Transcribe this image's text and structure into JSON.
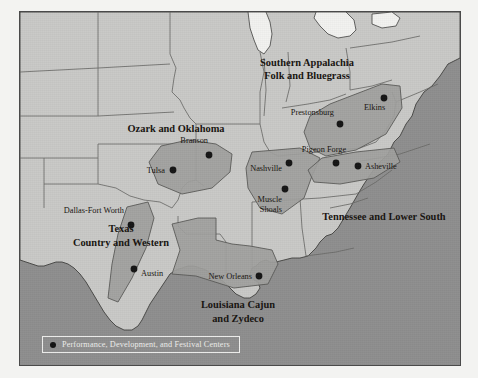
{
  "figure": {
    "type": "thematic-map",
    "colors": {
      "water": "#8e8e8e",
      "land": "#c9c9c7",
      "lake": "#f2f2f0",
      "region_fill": "#9f9f9d",
      "region_outline": "#5a5a58",
      "state_border": "#6a6a68",
      "coastline": "#3f3f3d",
      "label_text": "#17130f",
      "legend_text": "#efefed",
      "plate_border": "#4a4a4a",
      "paper": "#f3f3f1"
    }
  },
  "regions": [
    {
      "id": "southern-appalachia",
      "label": "Southern Appalachia\nFolk and Bluegrass",
      "x": 286,
      "y": 52
    },
    {
      "id": "ozark-oklahoma",
      "label": "Ozark and Oklahoma",
      "x": 155,
      "y": 118
    },
    {
      "id": "tennessee-lower-south",
      "label": "Tennessee and Lower South",
      "x": 365,
      "y": 206
    },
    {
      "id": "texas-country-western",
      "label": "Texas\nCountry and Western",
      "x": 101,
      "y": 219
    },
    {
      "id": "louisiana-cajun",
      "label": "Louisiana Cajun\nand Zydeco",
      "x": 218,
      "y": 294
    }
  ],
  "cities": [
    {
      "id": "branson",
      "label": "Branson",
      "dot_x": 189,
      "dot_y": 143,
      "label_x": 188,
      "label_y": 128,
      "anchor": "end"
    },
    {
      "id": "tulsa",
      "label": "Tulsa",
      "dot_x": 153,
      "dot_y": 158,
      "label_x": 145,
      "label_y": 154,
      "anchor": "end"
    },
    {
      "id": "dallas-fort-worth",
      "label": "Dallas-Fort Worth",
      "dot_x": 111,
      "dot_y": 213,
      "label_x": 104,
      "label_y": 199,
      "anchor": "end"
    },
    {
      "id": "austin",
      "label": "Austin",
      "dot_x": 114,
      "dot_y": 257,
      "label_x": 120,
      "label_y": 263,
      "anchor": "start"
    },
    {
      "id": "new-orleans",
      "label": "New Orleans",
      "dot_x": 239,
      "dot_y": 264,
      "label_x": 232,
      "label_y": 260,
      "anchor": "end"
    },
    {
      "id": "nashville",
      "label": "Nashville",
      "dot_x": 269,
      "dot_y": 151,
      "label_x": 262,
      "label_y": 157,
      "anchor": "end"
    },
    {
      "id": "muscle-shoals",
      "label": "Muscle\nShoals",
      "dot_x": 265,
      "dot_y": 177,
      "label_x": 261,
      "label_y": 184,
      "anchor": "end"
    },
    {
      "id": "pigeon-forge",
      "label": "Pigeon Forge",
      "dot_x": 316,
      "dot_y": 151,
      "label_x": 303,
      "label_y": 135,
      "anchor": "middle"
    },
    {
      "id": "asheville",
      "label": "Asheville",
      "dot_x": 338,
      "dot_y": 154,
      "label_x": 344,
      "label_y": 154,
      "anchor": "start"
    },
    {
      "id": "prestonsburg",
      "label": "Prestonsburg",
      "dot_x": 320,
      "dot_y": 112,
      "label_x": 314,
      "label_y": 100,
      "anchor": "end"
    },
    {
      "id": "elkins",
      "label": "Elkins",
      "dot_x": 364,
      "dot_y": 86,
      "label_x": 343,
      "label_y": 95,
      "anchor": "start"
    }
  ],
  "legend": {
    "text": "Performance, Development, and Festival Centers",
    "symbol": "filled-circle"
  }
}
